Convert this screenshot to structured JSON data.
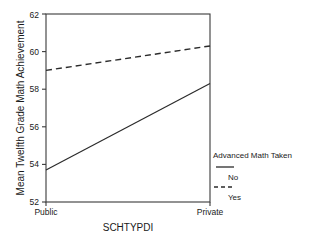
{
  "chart_data": {
    "type": "line",
    "title": "",
    "xlabel": "SCHTYPDI",
    "ylabel": "Mean Twelfth Grade Math Achievement",
    "categories": [
      "Public",
      "Private"
    ],
    "ylim": [
      52,
      62
    ],
    "yticks": [
      52,
      54,
      56,
      58,
      60,
      62
    ],
    "ytick_labels": [
      "52",
      "54",
      "56",
      "58",
      "60",
      "62"
    ],
    "grid": false,
    "legend_position": "right-outside",
    "legend_title": "Advanced Math Taken",
    "series": [
      {
        "name": "No",
        "style": "solid",
        "color": "#2b2b2b",
        "values": [
          53.7,
          58.3
        ]
      },
      {
        "name": "Yes",
        "style": "dashed",
        "color": "#2b2b2b",
        "values": [
          59.0,
          60.3
        ]
      }
    ]
  },
  "axis": {
    "y_tick_0": "52",
    "y_tick_1": "54",
    "y_tick_2": "56",
    "y_tick_3": "58",
    "y_tick_4": "60",
    "y_tick_5": "62",
    "x_tick_0": "Public",
    "x_tick_1": "Private",
    "x_title": "SCHTYPDI",
    "y_title": "Mean Twelfth Grade Math Achievement"
  },
  "legend": {
    "title": "Advanced Math Taken",
    "item_0_label": "No",
    "item_1_label": "Yes"
  }
}
